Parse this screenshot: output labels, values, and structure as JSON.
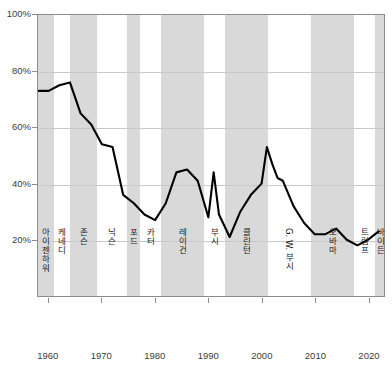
{
  "chart_data": {
    "type": "line",
    "title": "",
    "xlabel": "",
    "ylabel": "",
    "xlim": [
      1958,
      2023
    ],
    "ylim": [
      0,
      100
    ],
    "grid": true,
    "legend_position": "none",
    "y_ticks": [
      "20%",
      "40%",
      "60%",
      "80%",
      "100%"
    ],
    "y_tick_values": [
      20,
      40,
      60,
      80,
      100
    ],
    "x_ticks": [
      "1960",
      "1970",
      "1980",
      "1990",
      "2000",
      "2010",
      "2020"
    ],
    "x_tick_values": [
      1960,
      1970,
      1980,
      1990,
      2000,
      2010,
      2020
    ],
    "line_color": "#000000",
    "band_color": "#d9d9d9",
    "series": [
      {
        "name": "",
        "x": [
          1958,
          1960,
          1962,
          1964,
          1966,
          1968,
          1970,
          1972,
          1974,
          1976,
          1978,
          1980,
          1982,
          1984,
          1986,
          1988,
          1990,
          1991,
          1992,
          1994,
          1996,
          1998,
          2000,
          2001,
          2002,
          2003,
          2004,
          2006,
          2008,
          2010,
          2012,
          2014,
          2016,
          2018,
          2020,
          2022
        ],
        "values": [
          73,
          73,
          75,
          76,
          65,
          61,
          54,
          53,
          36,
          33,
          29,
          27,
          33,
          44,
          45,
          41,
          28,
          44,
          29,
          21,
          30,
          36,
          40,
          53,
          47,
          42,
          41,
          32,
          26,
          22,
          22,
          24,
          20,
          18,
          20,
          23
        ]
      }
    ],
    "presidential_terms": [
      {
        "name": "아이젠하워",
        "start": 1958,
        "end": 1961,
        "shaded": true
      },
      {
        "name": "케네디",
        "start": 1961,
        "end": 1963.9,
        "shaded": false
      },
      {
        "name": "존슨",
        "start": 1963.9,
        "end": 1969,
        "shaded": true
      },
      {
        "name": "닉슨",
        "start": 1969,
        "end": 1974.6,
        "shaded": false
      },
      {
        "name": "포드",
        "start": 1974.6,
        "end": 1977,
        "shaded": true
      },
      {
        "name": "카터",
        "start": 1977,
        "end": 1981,
        "shaded": false
      },
      {
        "name": "레이건",
        "start": 1981,
        "end": 1989,
        "shaded": true
      },
      {
        "name": "부시",
        "start": 1989,
        "end": 1993,
        "shaded": false
      },
      {
        "name": "클린턴",
        "start": 1993,
        "end": 2001,
        "shaded": true
      },
      {
        "name": "G. W. 부시",
        "start": 2001,
        "end": 2009,
        "shaded": false
      },
      {
        "name": "오바마",
        "start": 2009,
        "end": 2017,
        "shaded": true
      },
      {
        "name": "트럼프",
        "start": 2017,
        "end": 2021,
        "shaded": false
      },
      {
        "name": "바이든",
        "start": 2021,
        "end": 2023,
        "shaded": true
      }
    ]
  }
}
